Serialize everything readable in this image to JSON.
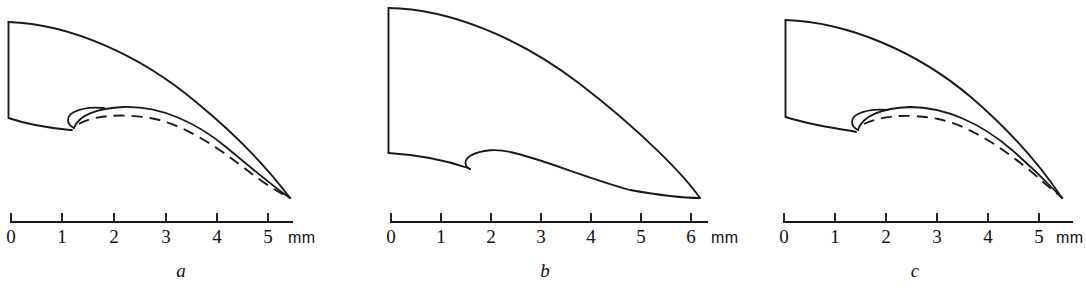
{
  "figure": {
    "background_color": "#ffffff",
    "ink_color": "#1a1a1a",
    "width": 1086,
    "height": 288,
    "panel_count": 3
  },
  "panels": [
    {
      "id": "a",
      "label": "a",
      "label_x": 181,
      "label_y": 277,
      "scale": {
        "unit": "mm",
        "unit_label_x": 298,
        "unit_label_y": 243,
        "axis_y": 222,
        "axis_x_start": 10,
        "axis_x_end": 293,
        "tick_height": 9,
        "tick_label_y": 243,
        "ticks": [
          {
            "label": "0",
            "value": 0,
            "x": 10
          },
          {
            "label": "1",
            "value": 1,
            "x": 62
          },
          {
            "label": "2",
            "value": 2,
            "x": 114
          },
          {
            "label": "3",
            "value": 3,
            "x": 166
          },
          {
            "label": "4",
            "value": 4,
            "x": 217
          },
          {
            "label": "5",
            "value": 5,
            "x": 268
          }
        ]
      },
      "has_dashed_overlay": true,
      "paths": {
        "outer_outline": "M 8.5 22 L 8.5 118 C 26 124 50 128 70 130 L 72 130",
        "upper_curve": "M 8.5 22 C 70 24 140 55 196 102 C 240 138 272 174 290 198",
        "inner_solid_crest": "M 74 128 C 78 116 96 108 124 107 C 160 106 196 122 226 147 C 256 172 278 190 290 198",
        "inner_hook": "M 74 128 C 66 124 66 116 74 112 C 82 108 94 107 104 108",
        "dashed_overlay": "M 79 124 C 92 116 120 113 150 118 C 186 124 224 152 252 174 C 272 189 284 195 291 198"
      }
    },
    {
      "id": "b",
      "label": "b",
      "label_x": 545,
      "label_y": 277,
      "scale": {
        "unit": "mm",
        "unit_label_x": 712,
        "unit_label_y": 243,
        "axis_y": 222,
        "axis_x_start": 390,
        "axis_x_end": 708,
        "tick_height": 9,
        "tick_label_y": 243,
        "ticks": [
          {
            "label": "0",
            "value": 0,
            "x": 390
          },
          {
            "label": "1",
            "value": 1,
            "x": 440
          },
          {
            "label": "2",
            "value": 2,
            "x": 491
          },
          {
            "label": "3",
            "value": 3,
            "x": 541
          },
          {
            "label": "4",
            "value": 4,
            "x": 591
          },
          {
            "label": "5",
            "value": 5,
            "x": 641
          },
          {
            "label": "6",
            "value": 6,
            "x": 691
          }
        ]
      },
      "has_dashed_overlay": false,
      "paths": {
        "outer_outline": "M 388.5 8 L 388.5 153",
        "upper_curve": "M 388.5 8 C 450 9 520 38 580 84 C 640 130 684 175 700 198",
        "inner_solid_crest": "M 388.5 153 C 420 155 448 161 468 168 L 470 169",
        "inner_hook": "M 470 169 C 464 166 464 160 470 156 C 482 149 498 149 510 152 C 540 158 580 176 630 190 C 664 196 690 198 700 198",
        "dashed_overlay": ""
      }
    },
    {
      "id": "c",
      "label": "c",
      "label_x": 915,
      "label_y": 277,
      "scale": {
        "unit": "mm",
        "unit_label_x": 1056,
        "unit_label_y": 243,
        "axis_y": 222,
        "axis_x_start": 783,
        "axis_x_end": 1073,
        "tick_height": 9,
        "tick_label_y": 243,
        "ticks": [
          {
            "label": "0",
            "value": 0,
            "x": 783
          },
          {
            "label": "1",
            "value": 1,
            "x": 835
          },
          {
            "label": "2",
            "value": 2,
            "x": 886
          },
          {
            "label": "3",
            "value": 3,
            "x": 937
          },
          {
            "label": "4",
            "value": 4,
            "x": 988
          },
          {
            "label": "5",
            "value": 5,
            "x": 1039
          }
        ]
      },
      "has_dashed_overlay": true,
      "paths": {
        "outer_outline": "M 785.5 20 L 785.5 117 C 805 123 832 128 852 131 L 856 132",
        "upper_curve": "M 785.5 20 C 848 22 918 52 972 98 C 1016 136 1046 174 1062 198",
        "inner_solid_crest": "M 858 130 C 862 116 882 108 910 107 C 946 107 982 124 1012 150 C 1040 174 1054 190 1062 198",
        "inner_hook": "M 858 130 C 850 126 850 118 858 114 C 866 110 878 109 888 110",
        "dashed_overlay": "M 864 124 C 880 116 908 113 938 119 C 972 126 1008 152 1034 174 C 1050 188 1058 195 1063 198"
      }
    }
  ]
}
